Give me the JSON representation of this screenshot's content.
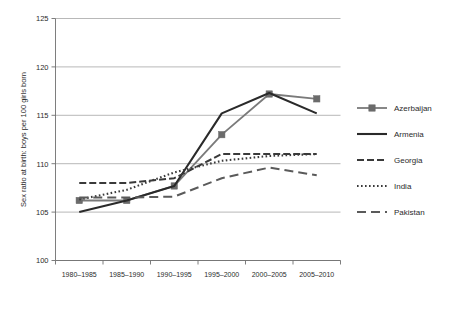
{
  "chart_data": {
    "type": "line",
    "title": "",
    "xlabel": "",
    "ylabel": "Sex ratio at birth: boys per 100 girls born",
    "categories": [
      "1980–1985",
      "1985–1990",
      "1990–1995",
      "1995–2000",
      "2000–2005",
      "2005–2010"
    ],
    "ylim": [
      100,
      125
    ],
    "yticks": [
      100,
      105,
      110,
      115,
      120,
      125
    ],
    "ytick_labels": [
      "100",
      "105",
      "110",
      "115",
      "120",
      "125"
    ],
    "grid": true,
    "legend_position": "right",
    "series": [
      {
        "name": "Azerbaijan",
        "values": [
          106.2,
          106.2,
          107.7,
          113.0,
          117.2,
          116.7
        ],
        "color": "#7a7a7a",
        "marker": "square",
        "marker_color": "#6b6b6b",
        "dash": "none",
        "width": 1.8
      },
      {
        "name": "Armenia",
        "values": [
          105.0,
          106.2,
          107.7,
          115.2,
          117.3,
          115.2
        ],
        "color": "#2a2a2a",
        "marker": "none",
        "marker_color": "#2a2a2a",
        "dash": "none",
        "width": 2.1
      },
      {
        "name": "Georgia",
        "values": [
          108.0,
          108.0,
          108.5,
          111.0,
          111.0,
          111.0
        ],
        "color": "#3a3a3a",
        "marker": "none",
        "marker_color": "#3a3a3a",
        "dash": "7,3",
        "width": 2.0
      },
      {
        "name": "India",
        "values": [
          106.3,
          107.3,
          109.1,
          110.3,
          110.8,
          111.0
        ],
        "color": "#3a3a3a",
        "marker": "none",
        "marker_color": "#3a3a3a",
        "dash": "1.6,2.4",
        "width": 2.1
      },
      {
        "name": "Pakistan",
        "values": [
          106.5,
          106.5,
          106.6,
          108.5,
          109.6,
          108.8
        ],
        "color": "#5a5a5a",
        "marker": "none",
        "marker_color": "#5a5a5a",
        "dash": "9,5",
        "width": 2.0
      }
    ]
  },
  "legend": {
    "items": [
      {
        "label": "Azerbaijan"
      },
      {
        "label": "Armenia"
      },
      {
        "label": "Georgia"
      },
      {
        "label": "India"
      },
      {
        "label": "Pakistan"
      }
    ]
  },
  "axes": {
    "y_title": "Sex ratio at birth: boys per 100 girls born"
  },
  "caption": {
    "text": ""
  }
}
